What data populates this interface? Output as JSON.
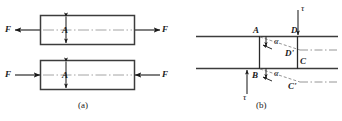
{
  "figure": {
    "width": 342,
    "height": 121,
    "background": "#ffffff",
    "ink": "#1a1a1a",
    "centerline_color": "#8a8a8a"
  },
  "panel_a": {
    "caption": "(a)",
    "description": "Axial tension and compression of a prismatic bar of cross-sectional area A",
    "bars": [
      {
        "name": "tension-bar",
        "area_label": "A",
        "left_force_label": "F",
        "right_force_label": "F",
        "left_arrow_direction": "left",
        "right_arrow_direction": "right",
        "loading": "tension"
      },
      {
        "name": "compression-bar",
        "area_label": "A",
        "left_force_label": "F",
        "right_force_label": "F",
        "left_arrow_direction": "right",
        "right_arrow_direction": "left",
        "loading": "compression"
      }
    ]
  },
  "panel_b": {
    "caption": "(b)",
    "description": "Pure shear deformation of element ABCD into ABC'D' under shear stress tau, shear angle alpha",
    "shear_stress_label": "τ",
    "shear_angle_label": "α",
    "top_stress_label": "τ",
    "bottom_stress_label": "τ",
    "top_angle_label": "α",
    "bottom_angle_label": "α",
    "vertices": [
      {
        "name": "vertex-a",
        "label": "A"
      },
      {
        "name": "vertex-b",
        "label": "B"
      },
      {
        "name": "vertex-c",
        "label": "C"
      },
      {
        "name": "vertex-d",
        "label": "D"
      },
      {
        "name": "vertex-c-prime",
        "label": "C'"
      },
      {
        "name": "vertex-d-prime",
        "label": "D'"
      }
    ]
  }
}
